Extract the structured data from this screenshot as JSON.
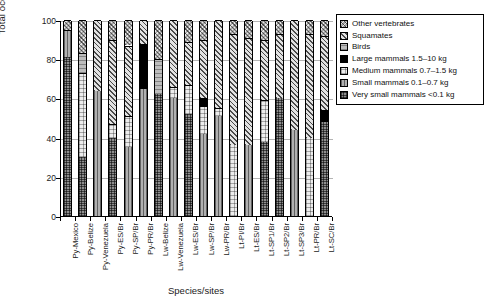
{
  "chart_data": {
    "type": "bar",
    "subtype": "stacked-percentage",
    "title": "",
    "xlabel": "Species/sites",
    "ylabel": "Total occurrence (%)",
    "ylim": [
      0,
      100
    ],
    "yticks": [
      0,
      20,
      40,
      60,
      80,
      100
    ],
    "grid": true,
    "legend_position": "upper-right-outside",
    "categories": [
      "Py-Mexico",
      "Py-Belize",
      "Py-Venezuela",
      "Py-ES/Br",
      "Py-SP/Br",
      "Py-PR/Br",
      "Lw-Belize",
      "Lw-Venezuela",
      "Lw-ES/Br",
      "Lw-SP/Br",
      "Lw-PR/Br",
      "Lt-PI/Br",
      "Lt-ES/Br",
      "Lt-SP1/Br",
      "Lt-SP2/Br",
      "Lt-SP3/Br",
      "Lt-PR/Br",
      "Lt-SC/Br"
    ],
    "series": [
      {
        "name": "Very small mammals <0.1 kg",
        "key": "vsmall",
        "pattern": "dense-grid",
        "values": [
          81,
          30,
          0,
          40,
          0,
          0,
          62,
          0,
          52,
          0,
          0,
          0,
          0,
          38,
          60,
          0,
          0,
          48
        ]
      },
      {
        "name": "Small mammals 0.1–0.7 kg",
        "key": "small",
        "pattern": "vertical-lines",
        "values": [
          14,
          0,
          64,
          0,
          35,
          65,
          0,
          60,
          0,
          42,
          51,
          0,
          36,
          0,
          0,
          44,
          0,
          0
        ]
      },
      {
        "name": "Medium mammals 0.7–1.5 kg",
        "key": "med",
        "pattern": "fine-grid",
        "values": [
          0,
          43,
          0,
          7,
          16,
          0,
          0,
          6,
          15,
          14,
          4,
          36,
          0,
          21,
          0,
          0,
          40,
          0
        ]
      },
      {
        "name": "Large mammals 1.5–10 kg",
        "key": "large",
        "pattern": "solid-black",
        "values": [
          0,
          0,
          0,
          0,
          0,
          23,
          0,
          0,
          0,
          4,
          0,
          0,
          0,
          0,
          0,
          0,
          0,
          6
        ]
      },
      {
        "name": "Birds",
        "key": "bird",
        "pattern": "horizontal-lines",
        "values": [
          0,
          10,
          0,
          0,
          0,
          0,
          18,
          0,
          0,
          0,
          0,
          0,
          0,
          0,
          0,
          0,
          0,
          0
        ]
      },
      {
        "name": "Squamates",
        "key": "squa",
        "pattern": "diagonal-hatch",
        "values": [
          0,
          0,
          36,
          43,
          36,
          12,
          0,
          34,
          22,
          30,
          45,
          57,
          55,
          31,
          33,
          56,
          53,
          38
        ]
      },
      {
        "name": "Other vertebrates",
        "key": "other",
        "pattern": "cross-hatch",
        "values": [
          5,
          17,
          0,
          10,
          13,
          0,
          20,
          0,
          11,
          10,
          0,
          7,
          9,
          10,
          7,
          0,
          7,
          8
        ]
      }
    ]
  },
  "legend": {
    "items": [
      {
        "label": "Other vertebrates",
        "key": "other"
      },
      {
        "label": "Squamates",
        "key": "squa"
      },
      {
        "label": "Birds",
        "key": "bird"
      },
      {
        "label": "Large mammals 1.5–10 kg",
        "key": "large"
      },
      {
        "label": "Medium mammals 0.7–1.5 kg",
        "key": "med"
      },
      {
        "label": "Small mammals 0.1–0.7 kg",
        "key": "small"
      },
      {
        "label": "Very small mammals <0.1 kg",
        "key": "vsmall"
      }
    ]
  },
  "colors": {
    "axis": "#000000",
    "grid": "#b4b4b4",
    "large_mammals": "#000000",
    "background": "#ffffff"
  }
}
